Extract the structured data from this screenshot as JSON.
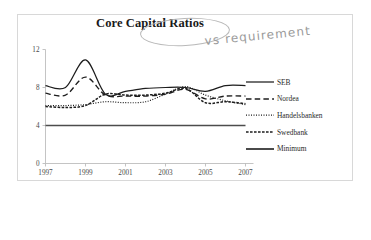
{
  "figure": {
    "title": "Core Capital Ratios",
    "annotation": {
      "text": "vs requirement",
      "circled_phrase": "Capital Ratios"
    }
  },
  "chart_data": {
    "type": "line",
    "title": "Core Capital Ratios",
    "xlabel": "",
    "ylabel": "",
    "xlim": [
      1997,
      2007
    ],
    "ylim": [
      0,
      12
    ],
    "yticks": [
      0,
      4,
      8,
      12
    ],
    "xticks": [
      1997,
      1999,
      2001,
      2003,
      2005,
      2007
    ],
    "grid": false,
    "legend_position": "right",
    "x": [
      1997,
      1998,
      1999,
      2000,
      2001,
      2002,
      2003,
      2004,
      2005,
      2006,
      2007
    ],
    "series": [
      {
        "name": "SEB",
        "style": "solid",
        "values": [
          8.2,
          8.0,
          10.9,
          7.3,
          7.6,
          7.9,
          8.0,
          8.0,
          7.6,
          8.2,
          8.2
        ]
      },
      {
        "name": "Nordea",
        "style": "dashed",
        "values": [
          7.4,
          7.2,
          9.1,
          7.2,
          7.1,
          7.1,
          7.3,
          7.8,
          6.8,
          7.1,
          7.1
        ]
      },
      {
        "name": "Handelsbanken",
        "style": "dotted",
        "values": [
          6.1,
          6.1,
          6.2,
          6.5,
          6.4,
          6.5,
          7.3,
          8.1,
          7.2,
          6.6,
          6.2
        ]
      },
      {
        "name": "Swedbank",
        "style": "dash-dot",
        "values": [
          6.0,
          5.9,
          6.1,
          7.3,
          7.2,
          7.2,
          7.4,
          7.9,
          6.4,
          6.5,
          6.3
        ]
      },
      {
        "name": "Minimum",
        "style": "solid-thick",
        "values": [
          4.0,
          4.0,
          4.0,
          4.0,
          4.0,
          4.0,
          4.0,
          4.0,
          4.0,
          4.0,
          4.0
        ]
      }
    ]
  },
  "legend": {
    "items": [
      {
        "label": "SEB",
        "dash": "none"
      },
      {
        "label": "Nordea",
        "dash": "5.5 3.2"
      },
      {
        "label": "Handelsbanken",
        "dash": "1 1.5"
      },
      {
        "label": "Swedbank",
        "dash": "2.6 1.4"
      },
      {
        "label": "Minimum",
        "dash": "none"
      }
    ]
  },
  "axes": {
    "y_labels": [
      "12",
      "8",
      "4",
      "0"
    ],
    "x_labels": [
      "1997",
      "1999",
      "2001",
      "2003",
      "2005",
      "2007"
    ]
  },
  "colors": {
    "ink": "#1d1d1d",
    "axis": "#b5b5b5",
    "frame": "#d8d8d8",
    "annotation": "#9a9a9a",
    "background": "#ffffff"
  }
}
